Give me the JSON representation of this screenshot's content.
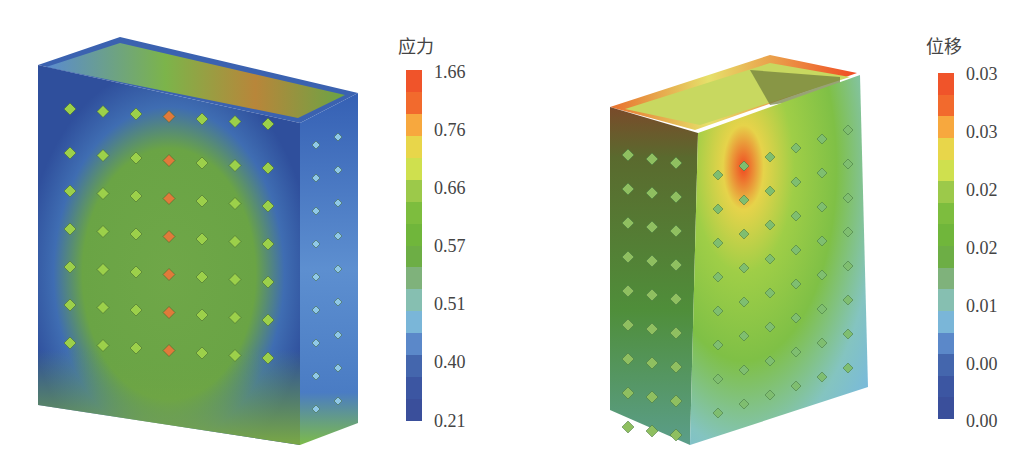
{
  "caption_fragment": "",
  "panels": [
    {
      "id": "stress",
      "legend_title": "应力",
      "tick_labels": [
        "1.66",
        "0.76",
        "0.66",
        "0.57",
        "0.51",
        "0.40",
        "0.21"
      ],
      "colors": [
        "#f0542a",
        "#f26a2d",
        "#f7a83e",
        "#e8d64a",
        "#cfe04e",
        "#9cc94a",
        "#7dbd3e",
        "#70b63b",
        "#6dae45",
        "#7fb27b",
        "#86bfb1",
        "#7ab6d8",
        "#5b88c9",
        "#4466ad",
        "#3c56a2",
        "#3a4f9b"
      ]
    },
    {
      "id": "displacement",
      "legend_title": "位移",
      "tick_labels": [
        "0.03",
        "0.03",
        "0.02",
        "0.02",
        "0.01",
        "0.00",
        "0.00"
      ],
      "colors": [
        "#f0542a",
        "#f26a2d",
        "#f7a83e",
        "#e8d64a",
        "#cfe04e",
        "#9cc94a",
        "#7dbd3e",
        "#70b63b",
        "#6dae45",
        "#7fb27b",
        "#86bfb1",
        "#7ab6d8",
        "#5b88c9",
        "#4466ad",
        "#3c56a2",
        "#3a4f9b"
      ]
    }
  ]
}
